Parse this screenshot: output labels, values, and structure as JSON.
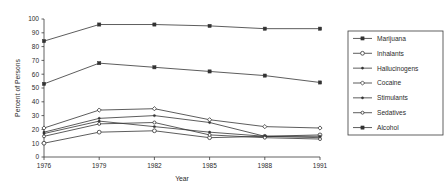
{
  "chart_data": {
    "type": "line",
    "title": "",
    "xlabel": "Year",
    "ylabel": "Percent of Persons",
    "x": [
      1976,
      1979,
      1982,
      1985,
      1988,
      1991
    ],
    "categories": [
      "1976",
      "1979",
      "1982",
      "1985",
      "1988",
      "1991"
    ],
    "xticklabels": [
      "1976",
      "1979",
      "1982",
      "1985",
      "1988",
      "1991"
    ],
    "yticklabels": [
      "0",
      "10",
      "20",
      "30",
      "40",
      "50",
      "60",
      "70",
      "80",
      "90",
      "100"
    ],
    "yticks": [
      0,
      10,
      20,
      30,
      40,
      50,
      60,
      70,
      80,
      90,
      100
    ],
    "ylim": [
      0,
      100
    ],
    "grid": false,
    "legend_position": "right",
    "series": [
      {
        "name": "Marijuana",
        "marker": "filled-square",
        "values": [
          53,
          68,
          65,
          62,
          59,
          54
        ]
      },
      {
        "name": "Inhalants",
        "marker": "open-circle",
        "values": [
          10,
          18,
          19,
          14,
          15,
          16
        ]
      },
      {
        "name": "Hallucinogens",
        "marker": "small-dot",
        "values": [
          18,
          28,
          30,
          25,
          15,
          14
        ]
      },
      {
        "name": "Cocaine",
        "marker": "open-diamond",
        "values": [
          21,
          34,
          35,
          27,
          22,
          21
        ]
      },
      {
        "name": "Stimulants",
        "marker": "small-dot",
        "values": [
          17,
          26,
          22,
          18,
          15,
          15
        ]
      },
      {
        "name": "Sedatives",
        "marker": "open-circle-small",
        "values": [
          15,
          24,
          25,
          16,
          14,
          13
        ]
      },
      {
        "name": "Alcohol",
        "marker": "filled-square",
        "values": [
          84,
          96,
          96,
          95,
          93,
          93
        ]
      }
    ]
  },
  "legend": {
    "entries": [
      {
        "label": "Marijuana"
      },
      {
        "label": "Inhalants"
      },
      {
        "label": "Hallucinogens"
      },
      {
        "label": "Cocaine"
      },
      {
        "label": "Stimulants"
      },
      {
        "label": "Sedatives"
      },
      {
        "label": "Alcohol"
      }
    ]
  },
  "colors": {
    "line": "#333333",
    "axis": "#3a3a3a",
    "text": "#2b2b2b",
    "background": "#ffffff"
  }
}
